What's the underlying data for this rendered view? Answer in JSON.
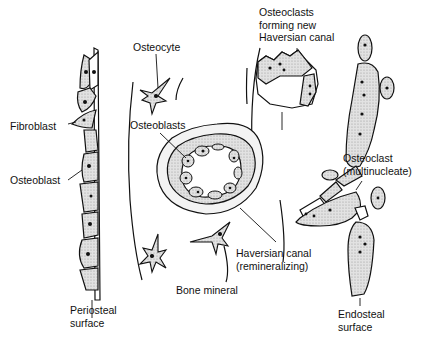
{
  "diagram": {
    "labels": {
      "fibroblast": "Fibroblast",
      "osteoblast": "Osteoblast",
      "periosteal_1": "Periosteal",
      "periosteal_2": "surface",
      "osteocyte": "Osteocyte",
      "osteoblasts": "Osteoblasts",
      "haversian_1": "Haversian canal",
      "haversian_2": "(remineralizing)",
      "bone_mineral": "Bone mineral",
      "osteoclasts_1": "Osteoclasts",
      "osteoclasts_2": "forming new",
      "osteoclasts_3": "Haversian canal",
      "osteoclast_1": "Osteoclast",
      "osteoclast_2": "(multinucleate)",
      "endosteal_1": "Endosteal",
      "endosteal_2": "surface"
    },
    "colors": {
      "ink": "#111111",
      "stipple": "#d4d4d4",
      "background": "#ffffff"
    }
  }
}
